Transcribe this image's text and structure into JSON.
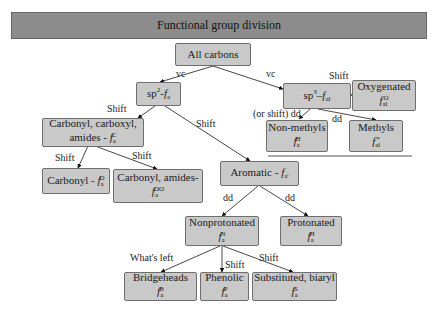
{
  "title": "Functional group division",
  "nodes": {
    "all_carbons": {
      "label": "All carbons"
    },
    "sp2": {
      "label": "sp",
      "sup": "2",
      "sep": "-",
      "sym": "f",
      "sub": "a"
    },
    "sp3": {
      "label": "sp",
      "sup": "3",
      "sep": "–",
      "sym": "f",
      "sub": "al"
    },
    "oxygenated": {
      "label": "Oxygenated",
      "sym": "f",
      "sub": "al",
      "symsup": "O"
    },
    "non_methyls": {
      "label": "Non-methyls",
      "sym": "f",
      "sub": "a",
      "symsup": "H"
    },
    "methyls": {
      "label": "Methyls",
      "sym": "f",
      "sub": "al",
      "symsup": "*"
    },
    "carbonyl_group": {
      "line1": "Carbonyl, carboxyl,",
      "line2": "amides -",
      "sym": "f",
      "sub": "a",
      "symsup": "C"
    },
    "carbonyl": {
      "label": "Carbonyl -",
      "sym": "f",
      "sub": "a",
      "symsup": "O"
    },
    "carbonyl_amides": {
      "label": "Carbonyl, amides-",
      "sym": "f",
      "sub": "a",
      "symsup": "OO"
    },
    "aromatic": {
      "label": "Aromatic -",
      "sym": "f",
      "sub": "a'"
    },
    "nonprotonated": {
      "label": "Nonprotonated",
      "sym": "f",
      "sub": "a",
      "symsup": "N"
    },
    "protonated": {
      "label": "Protonated",
      "sym": "f",
      "sub": "a",
      "symsup": "H"
    },
    "bridgeheads": {
      "label": "Bridgeheads",
      "sym": "f",
      "sub": "a",
      "symsup": "B"
    },
    "phenolic": {
      "label": "Phenolic",
      "sym": "f",
      "sub": "a",
      "symsup": "P"
    },
    "substituted": {
      "label": "Substituted, biaryl",
      "sym": "f",
      "sub": "a",
      "symsup": "S"
    }
  },
  "edge_labels": {
    "vc_left": "vc",
    "vc_right": "vc",
    "shift_oxygenated": "Shift",
    "or_shift_dd": "(or shift) dd",
    "dd_methyls": "dd",
    "shift_carbonyl_group": "Shift",
    "shift_aromatic": "Shift",
    "shift_carbonyl": "Shift",
    "shift_carbonyl_amides": "Shift",
    "dd_nonprotonated": "dd",
    "dd_protonated": "dd",
    "whats_left": "What's left",
    "shift_phenolic": "Shift",
    "shift_substituted": "Shift"
  }
}
